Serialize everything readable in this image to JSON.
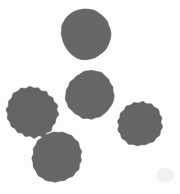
{
  "image": {
    "width": 180,
    "height": 194,
    "background_color": "#fdfdfd",
    "title": "Gray circular blobs on white background"
  },
  "palette": {
    "blob_fill": "#666666",
    "blob_edge": "#606060",
    "background": "#fdfdfd",
    "smudge": "#f0f0f0"
  },
  "shapes": [
    {
      "name": "blob-top-center",
      "label": "Top center blob",
      "cx": 86,
      "cy": 34,
      "r": 25,
      "fill": "#676767",
      "seed": 11,
      "bumps": 18,
      "amplitude": 1.1,
      "rotation": 0
    },
    {
      "name": "blob-middle-center",
      "label": "Middle center blob",
      "cx": 90,
      "cy": 95,
      "r": 24,
      "fill": "#666666",
      "seed": 27,
      "bumps": 17,
      "amplitude": 1.2,
      "rotation": 12
    },
    {
      "name": "blob-left-upper",
      "label": "Left upper blob",
      "cx": 32,
      "cy": 112,
      "r": 25,
      "fill": "#646464",
      "seed": 43,
      "bumps": 18,
      "amplitude": 1.3,
      "rotation": 25
    },
    {
      "name": "blob-left-lower",
      "label": "Left lower blob",
      "cx": 57,
      "cy": 157,
      "r": 25,
      "fill": "#666666",
      "seed": 59,
      "bumps": 17,
      "amplitude": 1.2,
      "rotation": 40
    },
    {
      "name": "blob-right",
      "label": "Right blob",
      "cx": 140,
      "cy": 124,
      "r": 22,
      "fill": "#656565",
      "seed": 71,
      "bumps": 16,
      "amplitude": 1.1,
      "rotation": 7
    }
  ],
  "artifacts": [
    {
      "name": "corner-smudge",
      "label": "Faint corner smudge",
      "x": 156,
      "y": 168,
      "width": 18,
      "height": 14,
      "fill": "#f1f1f1"
    }
  ],
  "counts": {
    "blob_count": 5,
    "touching_pairs": 1
  }
}
